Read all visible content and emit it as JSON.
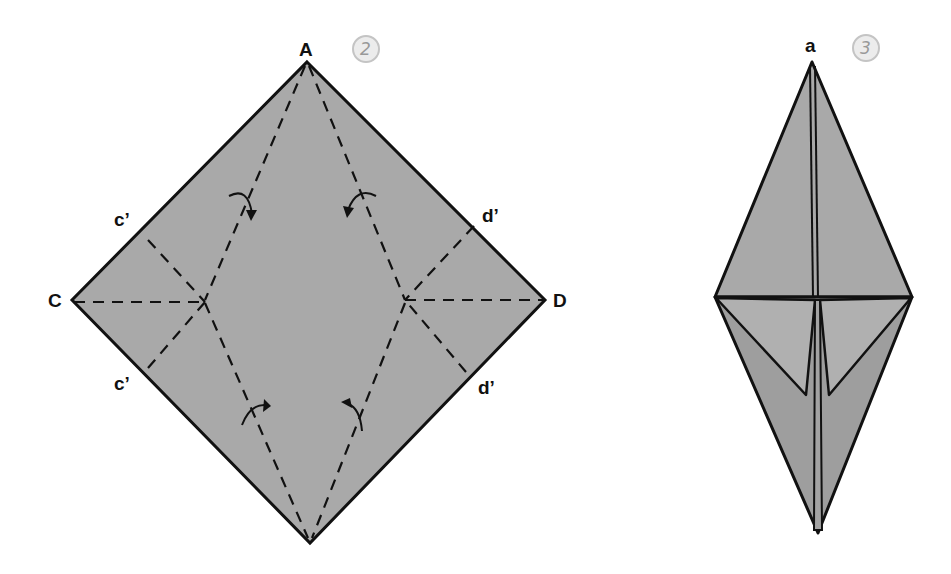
{
  "diagram": {
    "colors": {
      "paper": "#a9a9a9",
      "paper_shadow": "#9b9b9b",
      "line": "#111111",
      "step_badge": "#e9e9e9",
      "step_text": "#9a9a9a"
    },
    "step2": {
      "badge": "2",
      "labels": {
        "top": "A",
        "left": "C",
        "right": "D",
        "left_upper": "c’",
        "left_lower": "c’",
        "right_upper": "d’",
        "right_lower": "d’"
      },
      "icons": [
        "curved-arrow-icon",
        "curved-arrow-icon",
        "curved-arrow-icon",
        "curved-arrow-icon"
      ]
    },
    "step3": {
      "badge": "3",
      "labels": {
        "top": "a"
      }
    }
  }
}
